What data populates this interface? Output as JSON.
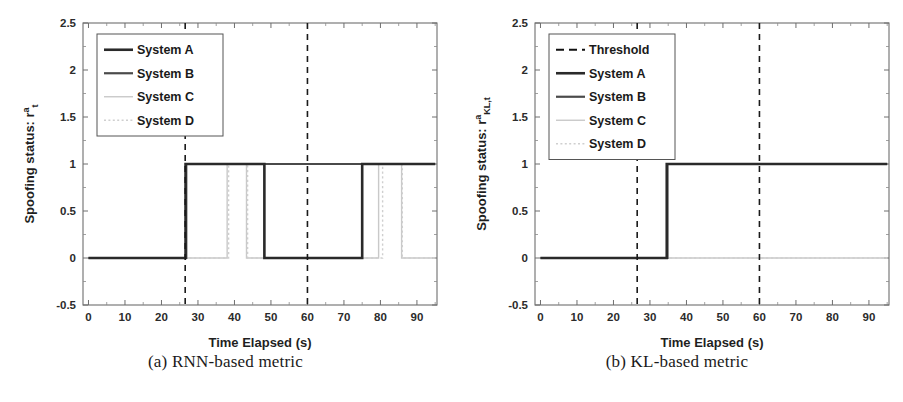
{
  "figure": {
    "background": "#ffffff",
    "panels": [
      {
        "id": "panel-a",
        "caption": "(a) RNN-based metric",
        "axis": {
          "xlabel": "Time Elapsed (s)",
          "ylabel_main": "Spoofing status: r",
          "ylabel_sup": "a",
          "ylabel_sub": "t",
          "xticks": [
            "0",
            "10",
            "20",
            "30",
            "40",
            "50",
            "60",
            "70",
            "80",
            "90"
          ],
          "xtick_values": [
            0,
            10,
            20,
            30,
            40,
            50,
            60,
            70,
            80,
            90
          ],
          "yticks": [
            "-0.5",
            "0",
            "0.5",
            "1",
            "1.5",
            "2",
            "2.5"
          ],
          "ytick_values": [
            -0.5,
            0,
            0.5,
            1,
            1.5,
            2,
            2.5
          ],
          "xlim": [
            -1.5,
            95.5
          ],
          "ylim": [
            -0.5,
            2.5
          ],
          "grid": false
        },
        "legend": {
          "position": "top-left",
          "items": [
            {
              "label": "System A",
              "color": "#2a2a2a",
              "style": "solid",
              "width": 2.6
            },
            {
              "label": "System B",
              "color": "#4a4a4a",
              "style": "solid",
              "width": 2.2
            },
            {
              "label": "System C",
              "color": "#c9c9c9",
              "style": "solid",
              "width": 1.4
            },
            {
              "label": "System D",
              "color": "#cfcfcf",
              "style": "dotted",
              "width": 1.4
            }
          ]
        },
        "threshold_lines": [
          26.5,
          60.0
        ],
        "threshold_color": "#1a1a1a"
      },
      {
        "id": "panel-b",
        "caption": "(b) KL-based metric",
        "axis": {
          "xlabel": "Time Elapsed (s)",
          "ylabel_main": "Spoofing status: r",
          "ylabel_sup": "a",
          "ylabel_sub": "KL,t",
          "xticks": [
            "0",
            "10",
            "20",
            "30",
            "40",
            "50",
            "60",
            "70",
            "80",
            "90"
          ],
          "xtick_values": [
            0,
            10,
            20,
            30,
            40,
            50,
            60,
            70,
            80,
            90
          ],
          "yticks": [
            "-0.5",
            "0",
            "0.5",
            "1",
            "1.5",
            "2",
            "2.5"
          ],
          "ytick_values": [
            -0.5,
            0,
            0.5,
            1,
            1.5,
            2,
            2.5
          ],
          "xlim": [
            -1.5,
            95.5
          ],
          "ylim": [
            -0.5,
            2.5
          ],
          "grid": false
        },
        "legend": {
          "position": "top-left",
          "items": [
            {
              "label": "Threshold",
              "color": "#111111",
              "style": "dashed",
              "width": 2.2
            },
            {
              "label": "System A",
              "color": "#2a2a2a",
              "style": "solid",
              "width": 2.6
            },
            {
              "label": "System B",
              "color": "#4a4a4a",
              "style": "solid",
              "width": 2.2
            },
            {
              "label": "System C",
              "color": "#c9c9c9",
              "style": "solid",
              "width": 1.4
            },
            {
              "label": "System D",
              "color": "#cfcfcf",
              "style": "dotted",
              "width": 1.4
            }
          ]
        },
        "threshold_lines": [
          26.5,
          60.0
        ],
        "threshold_color": "#1a1a1a"
      }
    ]
  },
  "chart_data": [
    {
      "type": "line",
      "id": "panel-a",
      "title": "(a) RNN-based metric",
      "xlabel": "Time Elapsed (s)",
      "ylabel": "Spoofing status: r^a_t",
      "xlim": [
        -1.5,
        95.5
      ],
      "ylim": [
        -0.5,
        2.5
      ],
      "grid": false,
      "legend_position": "top-left",
      "annotations": [
        {
          "type": "vline",
          "x": 26.5,
          "style": "dashed",
          "label": "threshold"
        },
        {
          "type": "vline",
          "x": 60.0,
          "style": "dashed",
          "label": "threshold"
        }
      ],
      "series": [
        {
          "name": "System A",
          "color": "#2a2a2a",
          "style": "solid",
          "step": true,
          "x": [
            0,
            26.6,
            26.6,
            48.2,
            48.2,
            75.0,
            75.0,
            95.0
          ],
          "y": [
            0,
            0,
            1,
            1,
            0,
            0,
            1,
            1
          ]
        },
        {
          "name": "System B",
          "color": "#4a4a4a",
          "style": "solid",
          "step": true,
          "x": [
            0,
            26.8,
            26.8,
            95.0
          ],
          "y": [
            0,
            0,
            1,
            1
          ]
        },
        {
          "name": "System C",
          "color": "#c9c9c9",
          "style": "solid",
          "step": true,
          "x": [
            0,
            38.0,
            38.0,
            43.3,
            43.3,
            79.5,
            79.5,
            85.8,
            85.8,
            95.0
          ],
          "y": [
            0,
            0,
            1,
            1,
            0,
            0,
            1,
            1,
            0,
            0
          ]
        },
        {
          "name": "System D",
          "color": "#cfcfcf",
          "style": "dotted",
          "step": true,
          "x": [
            0,
            38.4,
            38.4,
            43.6,
            43.6,
            80.6,
            80.6,
            86.0,
            86.0,
            95.0
          ],
          "y": [
            0,
            0,
            1,
            1,
            0,
            0,
            1,
            1,
            0,
            0
          ]
        }
      ]
    },
    {
      "type": "line",
      "id": "panel-b",
      "title": "(b) KL-based metric",
      "xlabel": "Time Elapsed (s)",
      "ylabel": "Spoofing status: r^a_KL,t",
      "xlim": [
        -1.5,
        95.5
      ],
      "ylim": [
        -0.5,
        2.5
      ],
      "grid": false,
      "legend_position": "top-left",
      "annotations": [
        {
          "type": "vline",
          "x": 26.5,
          "style": "dashed",
          "label": "Threshold"
        },
        {
          "type": "vline",
          "x": 60.0,
          "style": "dashed",
          "label": "Threshold"
        }
      ],
      "series": [
        {
          "name": "System A",
          "color": "#2a2a2a",
          "style": "solid",
          "step": true,
          "x": [
            0,
            34.6,
            34.6,
            95.0
          ],
          "y": [
            0,
            0,
            1,
            1
          ]
        },
        {
          "name": "System B",
          "color": "#4a4a4a",
          "style": "solid",
          "step": true,
          "x": [
            0,
            34.8,
            34.8,
            95.0
          ],
          "y": [
            0,
            0,
            1,
            1
          ]
        },
        {
          "name": "System C",
          "color": "#c9c9c9",
          "style": "solid",
          "step": true,
          "x": [
            0,
            95.0
          ],
          "y": [
            0,
            0
          ]
        },
        {
          "name": "System D",
          "color": "#cfcfcf",
          "style": "dotted",
          "step": true,
          "x": [
            0,
            95.0
          ],
          "y": [
            0,
            0
          ]
        }
      ]
    }
  ]
}
